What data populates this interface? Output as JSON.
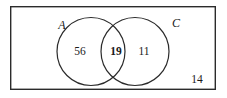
{
  "figure": {
    "type": "venn-diagram",
    "background_color": "#ffffff",
    "stroke_color": "#2b2b2b",
    "text_color": "#1a1a1a"
  },
  "universal_set": {
    "name": "universe-rectangle",
    "x": 10,
    "y": 6,
    "width": 206,
    "height": 84,
    "stroke_width": 1.4
  },
  "sets": [
    {
      "id": "A",
      "label": "A",
      "label_x": 62,
      "label_y": 25,
      "circle": {
        "cx": 91,
        "cy": 51.5,
        "r": 34
      },
      "stroke_width": 1.2
    },
    {
      "id": "C",
      "label": "C",
      "label_x": 176,
      "label_y": 23,
      "circle": {
        "cx": 135,
        "cy": 51.5,
        "r": 34
      },
      "stroke_width": 1.2
    }
  ],
  "regions": [
    {
      "id": "a-only",
      "label": "56",
      "bold": false,
      "x": 80,
      "y": 52,
      "meaning": "A only"
    },
    {
      "id": "both",
      "label": "19",
      "bold": true,
      "x": 116,
      "y": 52,
      "meaning": "A and C intersection"
    },
    {
      "id": "c-only",
      "label": "11",
      "bold": false,
      "x": 144,
      "y": 52,
      "meaning": "C only"
    },
    {
      "id": "outside",
      "label": "14",
      "bold": false,
      "x": 197,
      "y": 80,
      "meaning": "outside both sets"
    }
  ],
  "chart_data": {
    "type": "venn",
    "title": "",
    "set_labels": [
      "A",
      "C"
    ],
    "regions": {
      "A_only": 56,
      "intersection": 19,
      "C_only": 11,
      "outside": 14
    },
    "totals": {
      "A": 75,
      "C": 30,
      "universe": 100
    },
    "annotations": [
      "56",
      "19",
      "11",
      "14"
    ],
    "grid": false,
    "legend": "none"
  }
}
